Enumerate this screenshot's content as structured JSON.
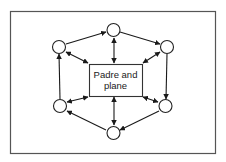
{
  "diagram": {
    "center": {
      "line1": "Padre and",
      "line2": "plane"
    },
    "nodes": [
      {
        "id": "top",
        "label": ""
      },
      {
        "id": "top-right",
        "label": ""
      },
      {
        "id": "bottom-right",
        "label": ""
      },
      {
        "id": "bottom",
        "label": ""
      },
      {
        "id": "bottom-left",
        "label": ""
      },
      {
        "id": "top-left",
        "label": ""
      }
    ],
    "outer_cycle": [
      "top-left",
      "top",
      "top-right",
      "bottom-right",
      "bottom",
      "bottom-left",
      "top-left"
    ],
    "spokes": [
      {
        "node": "top",
        "direction": "bidirectional"
      },
      {
        "node": "top-right",
        "direction": "bidirectional"
      },
      {
        "node": "bottom-right",
        "direction": "bidirectional"
      },
      {
        "node": "bottom",
        "direction": "bidirectional"
      },
      {
        "node": "bottom-left",
        "direction": "bidirectional"
      },
      {
        "node": "top-left",
        "direction": "bidirectional"
      }
    ]
  }
}
